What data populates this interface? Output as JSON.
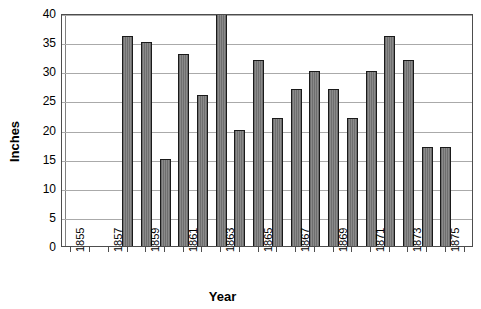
{
  "chart_data": {
    "type": "bar",
    "title": "",
    "xlabel": "Year",
    "ylabel": "Inches",
    "ylim": [
      0,
      40
    ],
    "ytick_step": 5,
    "yticks": [
      0,
      5,
      10,
      15,
      20,
      25,
      30,
      35,
      40
    ],
    "grid": "horizontal",
    "legend": "none",
    "x_all_years": [
      1855,
      1856,
      1857,
      1858,
      1859,
      1860,
      1861,
      1862,
      1863,
      1864,
      1865,
      1866,
      1867,
      1868,
      1869,
      1870,
      1871,
      1872,
      1873,
      1874,
      1875,
      1876
    ],
    "x_tick_labels": [
      "1855",
      "",
      "1857",
      "",
      "1859",
      "",
      "1861",
      "",
      "1863",
      "",
      "1865",
      "",
      "1867",
      "",
      "1869",
      "",
      "1871",
      "",
      "1873",
      "",
      "1875",
      ""
    ],
    "categories": [
      1858,
      1859,
      1860,
      1861,
      1862,
      1863,
      1864,
      1865,
      1866,
      1867,
      1868,
      1869,
      1870,
      1871,
      1872,
      1873,
      1874,
      1875
    ],
    "values": [
      36,
      35,
      15,
      33,
      26,
      40,
      20,
      32,
      22,
      27,
      30,
      27,
      22,
      30,
      36,
      32,
      17,
      17
    ],
    "empty_categories": [
      1855,
      1856,
      1857,
      1876
    ],
    "bar_color": "#787878",
    "bar_edge_color": "#1a1a1a",
    "grid_color": "#aaaaaa",
    "axis_color": "#4d4d4d"
  }
}
